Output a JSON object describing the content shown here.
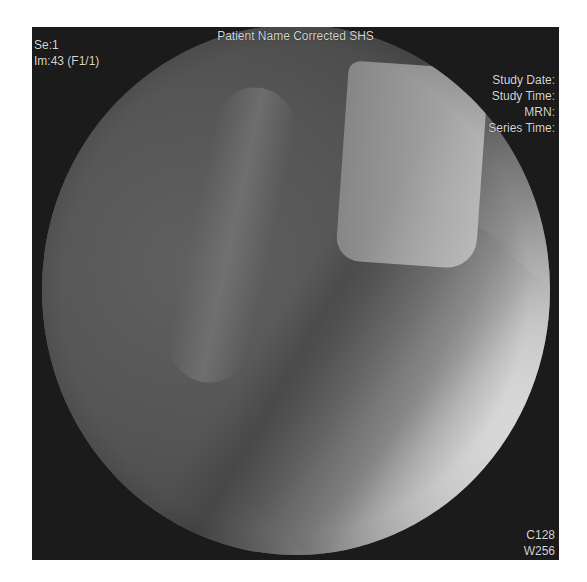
{
  "viewer": {
    "patient_name": "Patient Name Corrected SHS",
    "series": "Se:1",
    "image": "Im:43 (F1/1)",
    "study_date_label": "Study Date:",
    "study_time_label": "Study Time:",
    "mrn_label": "MRN:",
    "series_time_label": "Series Time:",
    "window_center": "C128",
    "window_width": "W256"
  },
  "colors": {
    "frame_background": "#1b1b1b",
    "overlay_text": "#d6d6d6",
    "page_background": "#ffffff"
  }
}
